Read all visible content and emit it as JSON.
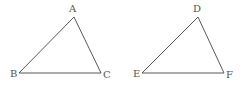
{
  "diagram": {
    "type": "geometry-triangles",
    "stroke_color": "#444444",
    "label_color": "#555555",
    "triangles": [
      {
        "name": "ABC",
        "vertices": [
          {
            "label": "A",
            "x": 74,
            "y": 17,
            "lx": 69,
            "ly": 12
          },
          {
            "label": "B",
            "x": 19,
            "y": 73,
            "lx": 10,
            "ly": 77
          },
          {
            "label": "C",
            "x": 101,
            "y": 73,
            "lx": 103,
            "ly": 78
          }
        ]
      },
      {
        "name": "DEF",
        "vertices": [
          {
            "label": "D",
            "x": 198,
            "y": 17,
            "lx": 193,
            "ly": 12
          },
          {
            "label": "E",
            "x": 142,
            "y": 73,
            "lx": 133,
            "ly": 77
          },
          {
            "label": "F",
            "x": 224,
            "y": 73,
            "lx": 226,
            "ly": 78
          }
        ]
      }
    ]
  }
}
